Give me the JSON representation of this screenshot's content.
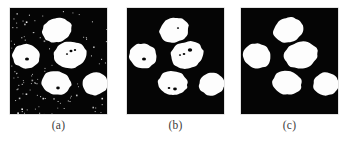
{
  "figure": {
    "type": "image-panel-series",
    "title": "",
    "background_color": "#ffffff",
    "panel_background_color": "#050505",
    "blob_color": "#fdfdfd",
    "caption_color": "#3c3c3c",
    "panel_count": 3,
    "panel_width": 97,
    "panel_height": 106,
    "panel_top": 8
  },
  "panels": [
    {
      "id": "panel-a",
      "caption": "(a)",
      "alt": "Binary segmentation of five cell nuclei with heavy speckle noise in the background",
      "x": 10,
      "y": 8,
      "width": 97,
      "height": 106,
      "noise_level": "high",
      "noise_speckle_count": 190,
      "blob_count": 5,
      "blobs": [
        {
          "name": "nucleus-top",
          "cx": 47,
          "cy": 22,
          "rx": 15,
          "ry": 12.5,
          "rot": -18,
          "holes": []
        },
        {
          "name": "nucleus-left",
          "cx": 16,
          "cy": 48,
          "rx": 14,
          "ry": 12.5,
          "rot": 12,
          "holes": [
            {
              "cx": 17,
              "cy": 51,
              "r": 2.0
            }
          ]
        },
        {
          "name": "nucleus-center",
          "cx": 60,
          "cy": 47,
          "rx": 17,
          "ry": 13.5,
          "rot": -14,
          "holes": [
            {
              "cx": 61,
              "cy": 43,
              "r": 1.5
            },
            {
              "cx": 65,
              "cy": 42,
              "r": 1.2
            },
            {
              "cx": 57,
              "cy": 46,
              "r": 1.1
            }
          ]
        },
        {
          "name": "nucleus-bottom-center",
          "cx": 46,
          "cy": 75,
          "rx": 15,
          "ry": 12,
          "rot": 8,
          "holes": [
            {
              "cx": 48,
              "cy": 80,
              "r": 1.8
            }
          ]
        },
        {
          "name": "nucleus-right",
          "cx": 85,
          "cy": 76,
          "rx": 13,
          "ry": 11.5,
          "rot": -8,
          "holes": []
        }
      ]
    },
    {
      "id": "panel-b",
      "caption": "(b)",
      "alt": "Partially cleaned segmentation: background noise removed, small holes remain inside nuclei",
      "x": 127,
      "y": 8,
      "width": 97,
      "height": 106,
      "noise_level": "none",
      "noise_speckle_count": 0,
      "blob_count": 5,
      "blobs": [
        {
          "name": "nucleus-top",
          "cx": 47,
          "cy": 22,
          "rx": 15,
          "ry": 12.5,
          "rot": -18,
          "holes": [
            {
              "cx": 51,
              "cy": 20,
              "r": 1.1
            }
          ]
        },
        {
          "name": "nucleus-left",
          "cx": 16,
          "cy": 48,
          "rx": 14,
          "ry": 12.5,
          "rot": 12,
          "holes": [
            {
              "cx": 17,
              "cy": 51,
              "r": 2.0
            }
          ]
        },
        {
          "name": "nucleus-center",
          "cx": 60,
          "cy": 47,
          "rx": 17,
          "ry": 13.5,
          "rot": -14,
          "holes": [
            {
              "cx": 63,
              "cy": 42,
              "r": 2.2
            },
            {
              "cx": 57,
              "cy": 46,
              "r": 1.3
            },
            {
              "cx": 53,
              "cy": 47,
              "r": 1.1
            }
          ]
        },
        {
          "name": "nucleus-bottom-center",
          "cx": 46,
          "cy": 75,
          "rx": 15,
          "ry": 12,
          "rot": 8,
          "holes": [
            {
              "cx": 48,
              "cy": 81,
              "r": 1.9
            },
            {
              "cx": 42,
              "cy": 80,
              "r": 1.3
            }
          ]
        },
        {
          "name": "nucleus-right",
          "cx": 85,
          "cy": 76,
          "rx": 13,
          "ry": 11.5,
          "rot": -8,
          "holes": []
        }
      ]
    },
    {
      "id": "panel-c",
      "caption": "(c)",
      "alt": "Fully cleaned segmentation: five smooth solid nuclei, no noise and no interior holes",
      "x": 241,
      "y": 8,
      "width": 97,
      "height": 106,
      "noise_level": "none",
      "noise_speckle_count": 0,
      "blob_count": 5,
      "blobs": [
        {
          "name": "nucleus-top",
          "cx": 47,
          "cy": 22,
          "rx": 15,
          "ry": 12.5,
          "rot": -18,
          "holes": []
        },
        {
          "name": "nucleus-left",
          "cx": 16,
          "cy": 48,
          "rx": 14,
          "ry": 12.5,
          "rot": 12,
          "holes": []
        },
        {
          "name": "nucleus-center",
          "cx": 60,
          "cy": 47,
          "rx": 17,
          "ry": 13.5,
          "rot": -14,
          "holes": []
        },
        {
          "name": "nucleus-bottom-center",
          "cx": 46,
          "cy": 75,
          "rx": 15,
          "ry": 12,
          "rot": 8,
          "holes": []
        },
        {
          "name": "nucleus-right",
          "cx": 85,
          "cy": 76,
          "rx": 13,
          "ry": 11.5,
          "rot": -8,
          "holes": []
        }
      ]
    }
  ],
  "captions": {
    "a": "(a)",
    "b": "(b)",
    "c": "(c)",
    "y": 118
  }
}
